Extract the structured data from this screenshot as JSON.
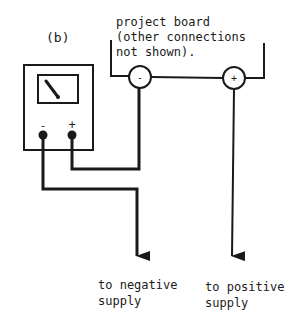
{
  "figure_label": "(b)",
  "project_board": {
    "line1": "project board",
    "line2": "(other connections",
    "line3": "not shown).",
    "negative_terminal": "-",
    "positive_terminal": "+"
  },
  "meter": {
    "negative_terminal": "-",
    "positive_terminal": "+"
  },
  "outputs": {
    "negative": {
      "line1": "to negative",
      "line2": "supply"
    },
    "positive": {
      "line1": "to positive",
      "line2": "supply"
    }
  },
  "colors": {
    "ink": "#1a1a1a",
    "background": "#ffffff"
  }
}
